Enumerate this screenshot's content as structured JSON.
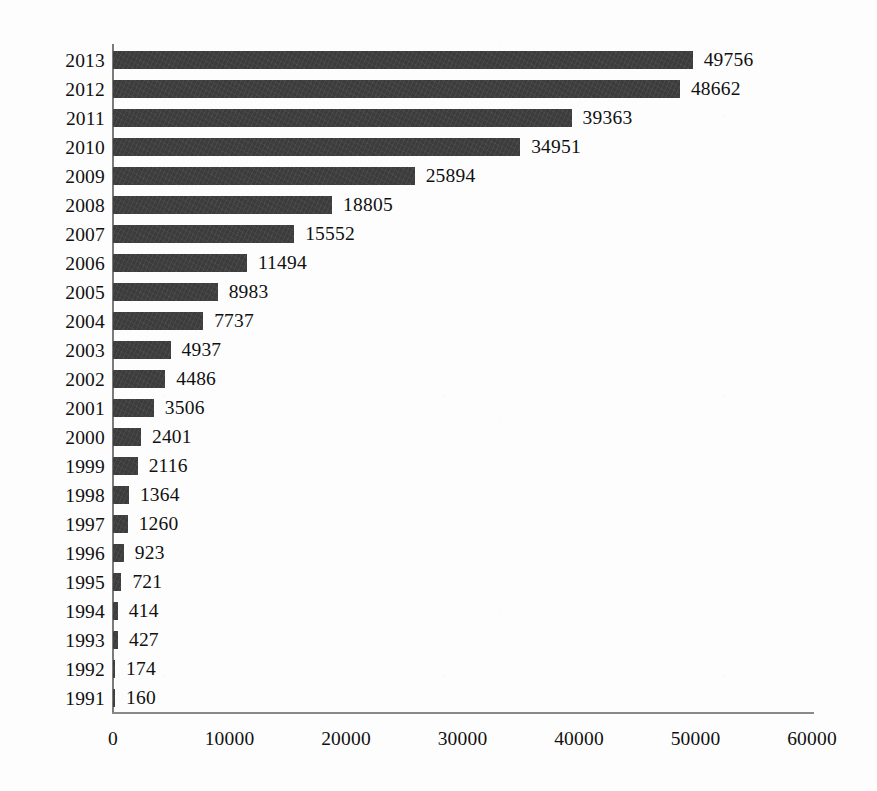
{
  "chart_data": {
    "type": "bar",
    "orientation": "horizontal",
    "title": "",
    "subtitle": "",
    "xlabel": "",
    "ylabel": "",
    "xlim": [
      0,
      60000
    ],
    "xticks": [
      0,
      10000,
      20000,
      30000,
      40000,
      50000,
      60000
    ],
    "xtick_labels": [
      "0",
      "10000",
      "20000",
      "30000",
      "40000",
      "50000",
      "60000"
    ],
    "grid": false,
    "legend": null,
    "legend_position": "none",
    "bar_color": "#3c3c3c",
    "value_labels_shown": true,
    "categories": [
      "2013",
      "2012",
      "2011",
      "2010",
      "2009",
      "2008",
      "2007",
      "2006",
      "2005",
      "2004",
      "2003",
      "2002",
      "2001",
      "2000",
      "1999",
      "1998",
      "1997",
      "1996",
      "1995",
      "1994",
      "1993",
      "1992",
      "1991"
    ],
    "values": [
      49756,
      48662,
      39363,
      34951,
      25894,
      18805,
      15552,
      11494,
      8983,
      7737,
      4937,
      4486,
      3506,
      2401,
      2116,
      1364,
      1260,
      923,
      721,
      414,
      427,
      174,
      160
    ],
    "value_label_texts": [
      "49756",
      "48662",
      "39363",
      "34951",
      "25894",
      "18805",
      "15552",
      "11494",
      "8983",
      "7737",
      "4937",
      "4486",
      "3506",
      "2401",
      "2116",
      "1364",
      "1260",
      "923",
      "721",
      "414",
      "427",
      "174",
      "160"
    ]
  }
}
